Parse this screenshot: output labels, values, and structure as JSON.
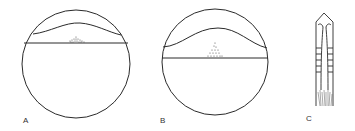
{
  "figure": {
    "panels": [
      {
        "id": "A",
        "label": "A",
        "description": "Circle with horizontal line and low arch above; stippled mound on line"
      },
      {
        "id": "B",
        "label": "B",
        "description": "Circle with horizontal line lower and taller arch; stippled triangular mound on line"
      },
      {
        "id": "C",
        "label": "C",
        "description": "Elongated tubular structure with pointed head, ladder-like segments and stippled base"
      }
    ],
    "colors": {
      "ink": "#2a2a2a",
      "background": "#ffffff"
    }
  }
}
